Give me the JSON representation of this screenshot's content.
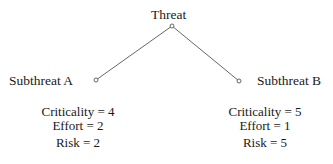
{
  "diagram": {
    "type": "attack-tree",
    "root": {
      "label": "Threat"
    },
    "children": [
      {
        "label": "Subthreat A",
        "metrics": {
          "criticality": "Criticality = 4",
          "effort": "Effort = 2",
          "risk": "Risk = 2"
        }
      },
      {
        "label": "Subthreat B",
        "metrics": {
          "criticality": "Criticality = 5",
          "effort": "Effort = 1",
          "risk": "Risk = 5"
        }
      }
    ],
    "colors": {
      "text": "#1a1a1a",
      "edge": "#555555",
      "background": "#ffffff"
    }
  }
}
